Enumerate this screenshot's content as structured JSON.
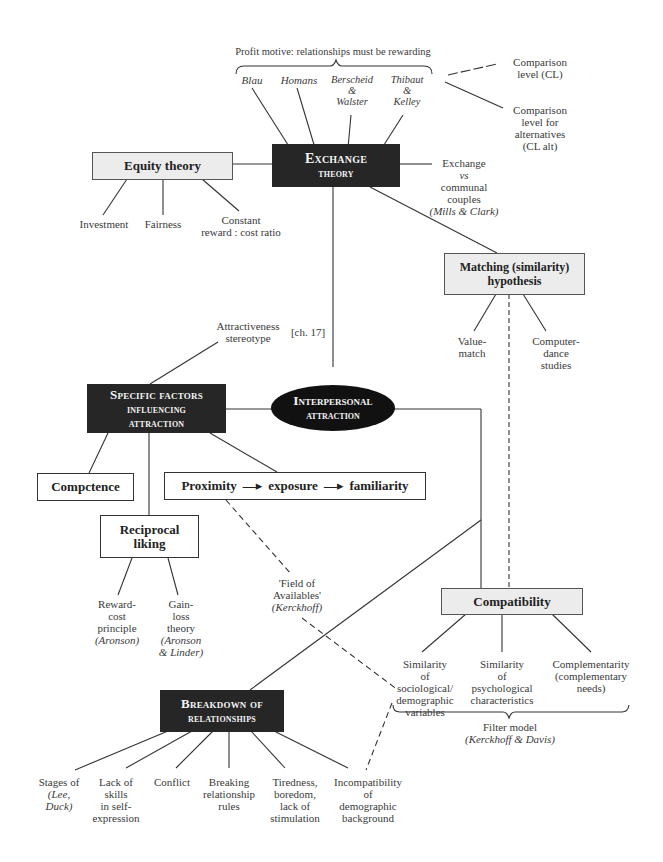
{
  "exchange": {
    "profit_label": "Profit motive: relationships must be rewarding",
    "theorists": [
      {
        "lines": [
          "Blau"
        ]
      },
      {
        "lines": [
          "Homans"
        ]
      },
      {
        "lines": [
          "Berscheid",
          "&",
          "Walster"
        ]
      },
      {
        "lines": [
          "Thibaut",
          "&",
          "Kelley"
        ]
      }
    ],
    "comparison_level": [
      "Comparison",
      "level (CL)"
    ],
    "comparison_alt": [
      "Comparison",
      "level for",
      "alternatives",
      "(CL alt)"
    ],
    "box": [
      "Exchange",
      "theory"
    ],
    "communal": [
      "Exchange",
      "vs",
      "communal",
      "couples",
      "(Mills & Clark)"
    ]
  },
  "equity": {
    "box": "Equity theory",
    "children": [
      {
        "lines": [
          "Investment"
        ]
      },
      {
        "lines": [
          "Fairness"
        ]
      },
      {
        "lines": [
          "Constant",
          "reward : cost ratio"
        ]
      }
    ]
  },
  "matching": {
    "box": [
      "Matching (similarity)",
      "hypothesis"
    ],
    "children": [
      {
        "lines": [
          "Value-",
          "match"
        ]
      },
      {
        "lines": [
          "Computer-",
          "dance",
          "studies"
        ]
      }
    ]
  },
  "attractiveness": {
    "lines": [
      "Attractiveness",
      "stereotype"
    ],
    "ref": "[ch. 17]"
  },
  "specific": {
    "box": [
      "Specific factors",
      "influencing",
      "attraction"
    ]
  },
  "central": {
    "box": [
      "Interpersonal",
      "attraction"
    ]
  },
  "competence": {
    "box": "Compctence"
  },
  "proximity": {
    "box": [
      "Proximity",
      "—▸",
      "exposure",
      "—▸",
      "familiarity"
    ]
  },
  "reciprocal": {
    "box": [
      "Reciprocal",
      "liking"
    ],
    "children": [
      {
        "lines": [
          "Reward-",
          "cost",
          "principle",
          "(Aronson)"
        ]
      },
      {
        "lines": [
          "Gain-",
          "loss",
          "theory",
          "(Aronson",
          "& Linder)"
        ]
      }
    ]
  },
  "field": {
    "lines": [
      "'Field of",
      "Availables'",
      "(Kerckhoff)"
    ]
  },
  "compatibility": {
    "box": "Compatibility",
    "children": [
      {
        "lines": [
          "Similarity",
          "of",
          "sociological/",
          "demographic",
          "variables"
        ]
      },
      {
        "lines": [
          "Similarity",
          "of",
          "psychological",
          "characteristics"
        ]
      },
      {
        "lines": [
          "Complementarity",
          "(complementary",
          "needs)"
        ]
      }
    ],
    "filter": [
      "Filter model",
      "(Kerckhoff & Davis)"
    ]
  },
  "breakdown": {
    "box": [
      "Breakdown of",
      "relationships"
    ],
    "children": [
      {
        "lines": [
          "Stages of",
          "(Lee,",
          "Duck)"
        ]
      },
      {
        "lines": [
          "Lack of",
          "skills",
          "in self-",
          "expression"
        ]
      },
      {
        "lines": [
          "Conflict"
        ]
      },
      {
        "lines": [
          "Breaking",
          "relationship",
          "rules"
        ]
      },
      {
        "lines": [
          "Tiredness,",
          "boredom,",
          "lack of",
          "stimulation"
        ]
      },
      {
        "lines": [
          "Incompatibility",
          "of",
          "demographic",
          "background"
        ]
      }
    ]
  },
  "colors": {
    "dark_box": "#262626",
    "grey_box": "#ececec",
    "line": "#333333",
    "ellipse": "#111111"
  }
}
